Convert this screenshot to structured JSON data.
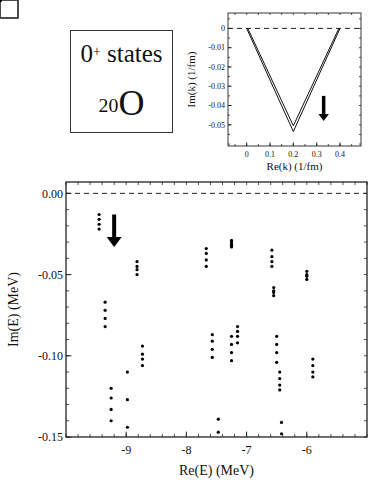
{
  "label_box": {
    "line1_main": "0",
    "line1_sup": "+",
    "line1_rest": " states",
    "line2_sup": "20",
    "line2_main": "O"
  },
  "chart_data": [
    {
      "id": "inset",
      "type": "line",
      "title": "",
      "xlabel": "Re(k) (1/fm)",
      "ylabel": "Im(k) (1/fm)",
      "xlim": [
        -0.08,
        0.49
      ],
      "ylim": [
        -0.061,
        0.008
      ],
      "xticks": [
        0,
        0.1,
        0.2,
        0.3,
        0.4
      ],
      "xtick_labels": [
        "0",
        "0.1",
        "0.2",
        "0.3",
        "0.4"
      ],
      "yticks": [
        0,
        -0.01,
        -0.02,
        -0.03,
        -0.04,
        -0.05
      ],
      "ytick_labels": [
        "0",
        "-0.01",
        "-0.02",
        "-0.03",
        "-0.04",
        "-0.05"
      ],
      "grid": false,
      "reference_line": {
        "y": 0,
        "style": "dashed"
      },
      "series": [
        {
          "name": "contour outer",
          "x": [
            0,
            0.2,
            0.4
          ],
          "y": [
            0,
            -0.0535,
            0
          ]
        },
        {
          "name": "contour inner",
          "x": [
            0.005,
            0.2,
            0.395
          ],
          "y": [
            0,
            -0.0505,
            0
          ]
        }
      ],
      "annotations": [
        {
          "type": "arrow-down",
          "x": 0.33,
          "y_from": -0.035,
          "y_to": -0.048
        }
      ]
    },
    {
      "id": "main",
      "type": "scatter",
      "title": "",
      "xlabel": "Re(E) (MeV)",
      "ylabel": "Im(E) (MeV)",
      "xlim": [
        -10.0,
        -5.0
      ],
      "ylim": [
        -0.15,
        0.007
      ],
      "xticks": [
        -9,
        -8,
        -7,
        -6
      ],
      "xtick_labels": [
        "-9",
        "-8",
        "-7",
        "-6"
      ],
      "yticks": [
        0.0,
        -0.05,
        -0.1,
        -0.15
      ],
      "ytick_labels": [
        "0.00",
        "-0.05",
        "-0.10",
        "-0.15"
      ],
      "grid": false,
      "reference_line": {
        "y": 0,
        "style": "dashed"
      },
      "boxed_points": [
        {
          "x": -8.35,
          "y": -0.022
        },
        {
          "x": -7.08,
          "y": -0.01
        },
        {
          "x": -6.0,
          "y": -0.026
        }
      ],
      "annotations": [
        {
          "type": "arrow-down",
          "x": -9.2,
          "y_from": -0.013,
          "y_to": -0.033
        }
      ],
      "series": [
        {
          "name": "continuum states",
          "points": [
            [
              -9.45,
              -0.013
            ],
            [
              -9.45,
              -0.016
            ],
            [
              -9.45,
              -0.019
            ],
            [
              -9.45,
              -0.022
            ],
            [
              -9.35,
              -0.067
            ],
            [
              -9.35,
              -0.072
            ],
            [
              -9.35,
              -0.077
            ],
            [
              -9.35,
              -0.082
            ],
            [
              -9.25,
              -0.12
            ],
            [
              -9.25,
              -0.126
            ],
            [
              -9.25,
              -0.133
            ],
            [
              -9.25,
              -0.14
            ],
            [
              -8.98,
              -0.11
            ],
            [
              -8.98,
              -0.127
            ],
            [
              -8.98,
              -0.144
            ],
            [
              -8.82,
              -0.042
            ],
            [
              -8.82,
              -0.045
            ],
            [
              -8.82,
              -0.047
            ],
            [
              -8.82,
              -0.05
            ],
            [
              -8.73,
              -0.094
            ],
            [
              -8.73,
              -0.099
            ],
            [
              -8.73,
              -0.102
            ],
            [
              -8.73,
              -0.106
            ],
            [
              -7.67,
              -0.034
            ],
            [
              -7.67,
              -0.037
            ],
            [
              -7.67,
              -0.041
            ],
            [
              -7.67,
              -0.045
            ],
            [
              -7.57,
              -0.087
            ],
            [
              -7.57,
              -0.091
            ],
            [
              -7.57,
              -0.096
            ],
            [
              -7.57,
              -0.101
            ],
            [
              -7.47,
              -0.139
            ],
            [
              -7.47,
              -0.147
            ],
            [
              -7.25,
              -0.029
            ],
            [
              -7.25,
              -0.03
            ],
            [
              -7.25,
              -0.031
            ],
            [
              -7.25,
              -0.032
            ],
            [
              -7.25,
              -0.033
            ],
            [
              -7.25,
              -0.088
            ],
            [
              -7.25,
              -0.093
            ],
            [
              -7.25,
              -0.098
            ],
            [
              -7.25,
              -0.103
            ],
            [
              -7.15,
              -0.082
            ],
            [
              -7.15,
              -0.085
            ],
            [
              -7.15,
              -0.088
            ],
            [
              -7.15,
              -0.092
            ],
            [
              -6.58,
              -0.035
            ],
            [
              -6.58,
              -0.039
            ],
            [
              -6.58,
              -0.042
            ],
            [
              -6.58,
              -0.045
            ],
            [
              -6.55,
              -0.058
            ],
            [
              -6.55,
              -0.06
            ],
            [
              -6.55,
              -0.061
            ],
            [
              -6.55,
              -0.063
            ],
            [
              -6.5,
              -0.088
            ],
            [
              -6.5,
              -0.093
            ],
            [
              -6.5,
              -0.098
            ],
            [
              -6.5,
              -0.104
            ],
            [
              -6.45,
              -0.11
            ],
            [
              -6.45,
              -0.114
            ],
            [
              -6.45,
              -0.118
            ],
            [
              -6.45,
              -0.121
            ],
            [
              -6.42,
              -0.141
            ],
            [
              -6.42,
              -0.148
            ],
            [
              -6.0,
              -0.048
            ],
            [
              -6.0,
              -0.05
            ],
            [
              -6.0,
              -0.051
            ],
            [
              -6.0,
              -0.053
            ],
            [
              -5.9,
              -0.102
            ],
            [
              -5.9,
              -0.106
            ],
            [
              -5.9,
              -0.11
            ],
            [
              -5.9,
              -0.113
            ]
          ]
        },
        {
          "name": "resonances (boxed)",
          "points": [
            [
              -8.35,
              -0.022
            ],
            [
              -7.08,
              -0.01
            ],
            [
              -6.0,
              -0.026
            ]
          ]
        }
      ]
    }
  ]
}
